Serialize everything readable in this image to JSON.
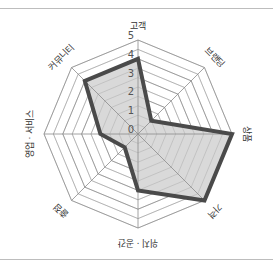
{
  "chart_data": {
    "type": "radar",
    "title": "",
    "categories": [
      "고객",
      "브랜딩",
      "상품",
      "가격",
      "위치 · 공간",
      "출점",
      "영업 · 서비스",
      "커뮤니티"
    ],
    "series": [
      {
        "name": "score",
        "values": [
          4,
          1,
          5,
          5,
          3,
          1,
          2,
          4
        ]
      }
    ],
    "rlim": [
      0,
      5
    ],
    "rticks": [
      0,
      1,
      2,
      3,
      4,
      5
    ],
    "grid": true,
    "grid_shape": "octagon",
    "legend": "none",
    "colors": {
      "fill": "#d9d9d9",
      "stroke": "#4a4a4a",
      "grid": "#8c8c8c",
      "text": "#333333"
    }
  }
}
